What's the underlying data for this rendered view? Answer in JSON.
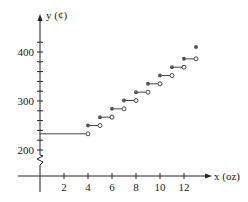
{
  "chart_data": {
    "type": "line",
    "subtype": "step",
    "title": "",
    "xlabel": "x (oz)",
    "ylabel": "y (¢)",
    "x_ticks": [
      2,
      4,
      6,
      8,
      10,
      12
    ],
    "y_ticks": [
      200,
      300,
      400
    ],
    "xlim": [
      0,
      13
    ],
    "ylim": [
      180,
      420
    ],
    "axis_break_y": true,
    "grid": false,
    "legend": null,
    "initial_segment": {
      "x_start": 0,
      "x_end": 4,
      "y": 233,
      "left_closed": true,
      "right_open": true
    },
    "steps": [
      {
        "x_start": 4,
        "x_end": 5,
        "y": 250
      },
      {
        "x_start": 5,
        "x_end": 6,
        "y": 267
      },
      {
        "x_start": 6,
        "x_end": 7,
        "y": 284
      },
      {
        "x_start": 7,
        "x_end": 8,
        "y": 301
      },
      {
        "x_start": 8,
        "x_end": 9,
        "y": 318
      },
      {
        "x_start": 9,
        "x_end": 10,
        "y": 335
      },
      {
        "x_start": 10,
        "x_end": 11,
        "y": 352
      },
      {
        "x_start": 11,
        "x_end": 12,
        "y": 369
      },
      {
        "x_start": 12,
        "x_end": 13,
        "y": 386
      }
    ],
    "final_point": {
      "x": 13,
      "y": 410,
      "closed": true
    },
    "colors": {
      "axis": "#222222",
      "line": "#444444",
      "point": "#555555"
    }
  },
  "labels": {
    "x_axis": "x (oz)",
    "y_axis": "y (¢)",
    "x_tick_labels": [
      "2",
      "4",
      "6",
      "8",
      "10",
      "12"
    ],
    "y_tick_labels": [
      "200",
      "300",
      "400"
    ]
  }
}
